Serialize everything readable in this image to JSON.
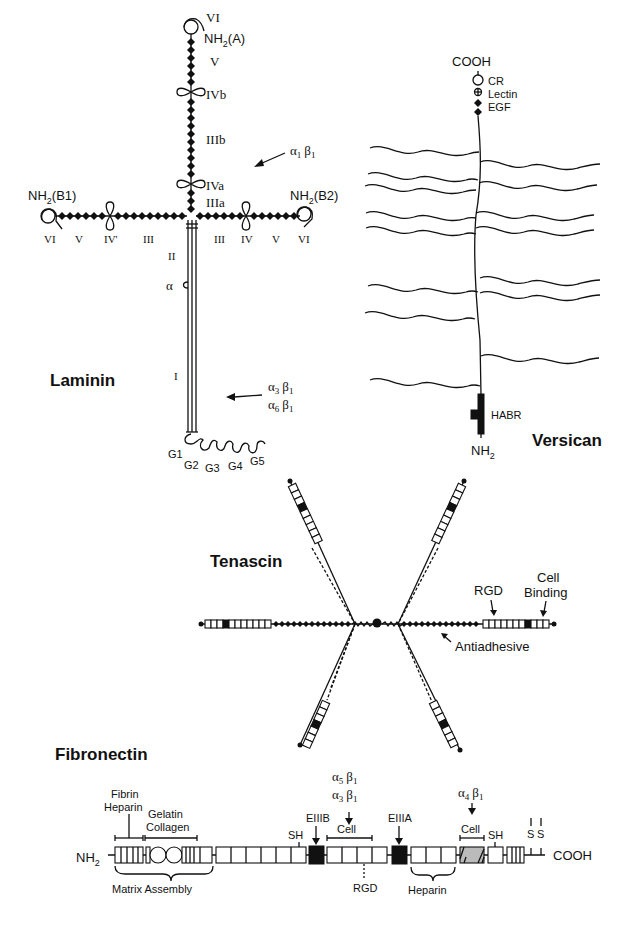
{
  "figure": {
    "panels": {
      "laminin": {
        "title": "Laminin",
        "chains": {
          "A": {
            "terminus": "NH2(A)",
            "domains": [
              "VI",
              "V",
              "IVb",
              "IIIb",
              "IVa",
              "IIIa"
            ]
          },
          "B1": {
            "terminus": "NH2(B1)",
            "domains": [
              "VI",
              "V",
              "IV'",
              "III"
            ]
          },
          "B2": {
            "terminus": "NH2(B2)",
            "domains": [
              "III",
              "IV",
              "V",
              "VI"
            ]
          },
          "long_arm": {
            "domains": [
              "II",
              "α",
              "I"
            ]
          },
          "globular": [
            "G1",
            "G2",
            "G3",
            "G4",
            "G5"
          ]
        },
        "receptors": {
          "upper": "α1 β1",
          "lower_1": "α3 β1",
          "lower_2": "α6 β1"
        },
        "labels": {
          "a_vi": "VI",
          "a_nh2": "NH",
          "a_nh2_sub": "2",
          "a_nh2_suffix": "(A)",
          "a_v": "V",
          "a_ivb": "IVb",
          "a_iiib": "IIIb",
          "a_iva": "IVa",
          "a_iiia": "IIIa",
          "b1_nh2": "NH",
          "b1_sub": "2",
          "b1_suffix": "(B1)",
          "b1_vi": "VI",
          "b1_v": "V",
          "b1_iv": "IV'",
          "b1_iii": "III",
          "b2_nh2": "NH",
          "b2_sub": "2",
          "b2_suffix": "(B2)",
          "b2_iii": "III",
          "b2_iv": "IV",
          "b2_v": "V",
          "b2_vi": "VI",
          "ii": "II",
          "alpha": "α",
          "i": "I",
          "g1": "G1",
          "g2": "G2",
          "g3": "G3",
          "g4": "G4",
          "g5": "G5",
          "r1_a": "α",
          "r1_a_sub": "1",
          "r1_b": "β",
          "r1_b_sub": "1",
          "r3_a": "α",
          "r3_a_sub": "3",
          "r3_b": "β",
          "r3_b_sub": "1",
          "r6_a": "α",
          "r6_a_sub": "6",
          "r6_b": "β",
          "r6_b_sub": "1"
        }
      },
      "versican": {
        "title": "Versican",
        "labels": {
          "cooh": "COOH",
          "cr": "CR",
          "lectin": "Lectin",
          "egf": "EGF",
          "habr": "HABR",
          "nh2": "NH",
          "nh2_sub": "2"
        }
      },
      "tenascin": {
        "title": "Tenascin",
        "labels": {
          "rgd": "RGD",
          "cell_binding_1": "Cell",
          "cell_binding_2": "Binding",
          "antiadhesive": "Antiadhesive"
        }
      },
      "fibronectin": {
        "title": "Fibronectin",
        "labels": {
          "nh2": "NH",
          "nh2_sub": "2",
          "fibrin": "Fibrin",
          "heparin_top": "Heparin",
          "gelatin": "Gelatin",
          "collagen": "Collagen",
          "matrix_assembly": "Matrix Assembly",
          "sh1": "SH",
          "eiiib": "EIIIB",
          "a5b1_a": "α",
          "a5b1_a_sub": "5",
          "a5b1_b": "β",
          "a5b1_b_sub": "1",
          "a3b1_a": "α",
          "a3b1_a_sub": "3",
          "a3b1_b": "β",
          "a3b1_b_sub": "1",
          "cell1": "Cell",
          "rgd": "RGD",
          "eiiia": "EIIIA",
          "heparin_bottom": "Heparin",
          "a4b1_a": "α",
          "a4b1_a_sub": "4",
          "a4b1_b": "β",
          "a4b1_b_sub": "1",
          "cell2": "Cell",
          "sh2": "SH",
          "s1": "S",
          "s2": "S",
          "cooh": "COOH"
        }
      }
    },
    "colors": {
      "ink": "#111111",
      "background": "#ffffff"
    }
  }
}
